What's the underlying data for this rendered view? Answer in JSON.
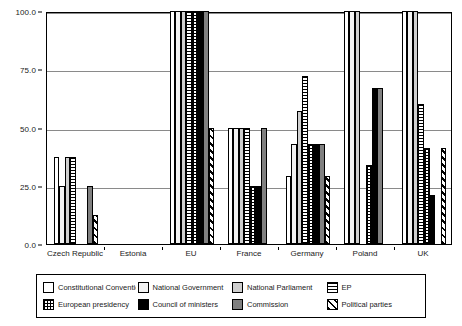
{
  "chart_data": {
    "type": "bar",
    "title": "",
    "subtitle": "",
    "xlabel": "",
    "ylabel": "",
    "ylim": [
      0,
      100
    ],
    "ytick_labels": [
      "0.0",
      "25.0",
      "50.0",
      "75.0",
      "100.0"
    ],
    "ytick_values": [
      0,
      25,
      50,
      75,
      100
    ],
    "grid": true,
    "legend_position": "bottom",
    "categories": [
      "Czech Republic",
      "Estonia",
      "EU",
      "France",
      "Germany",
      "Poland",
      "UK"
    ],
    "series": [
      {
        "name": "Constitutional Convention",
        "pattern": "plain",
        "values": [
          37.5,
          0,
          100,
          50,
          29,
          100,
          100
        ]
      },
      {
        "name": "National Government",
        "pattern": "dots-light",
        "values": [
          25,
          0,
          100,
          50,
          43,
          100,
          100
        ]
      },
      {
        "name": "National Parliament",
        "pattern": "dots-gray",
        "values": [
          37.5,
          0,
          100,
          50,
          57,
          100,
          100
        ]
      },
      {
        "name": "EP",
        "pattern": "hlines",
        "values": [
          37.5,
          0,
          100,
          50,
          72,
          0,
          60
        ]
      },
      {
        "name": "European presidency",
        "pattern": "grid",
        "values": [
          0,
          0,
          100,
          25,
          43,
          34,
          41
        ]
      },
      {
        "name": "Council of ministers",
        "pattern": "black",
        "values": [
          0,
          0,
          100,
          25,
          43,
          67,
          21
        ]
      },
      {
        "name": "Commission",
        "pattern": "darkgray",
        "values": [
          25,
          0,
          100,
          50,
          43,
          67,
          0
        ]
      },
      {
        "name": "Political parties",
        "pattern": "diag",
        "values": [
          12.5,
          0,
          50,
          0,
          29,
          0,
          41
        ]
      }
    ]
  },
  "legend": {
    "entries": [
      {
        "label": "Constitutional Convention",
        "pattern": "plain"
      },
      {
        "label": "National Government",
        "pattern": "dots-light"
      },
      {
        "label": "National Parliament",
        "pattern": "dots-gray"
      },
      {
        "label": "EP",
        "pattern": "hlines"
      },
      {
        "label": "European presidency",
        "pattern": "grid"
      },
      {
        "label": "Council of ministers",
        "pattern": "black"
      },
      {
        "label": "Commission",
        "pattern": "darkgray"
      },
      {
        "label": "Political parties",
        "pattern": "diag"
      }
    ]
  },
  "colors": {
    "axis": "#000000",
    "grid": "#8a8a8a",
    "background": "#ffffff",
    "black_series": "#000000",
    "gray_series": "#808080"
  }
}
